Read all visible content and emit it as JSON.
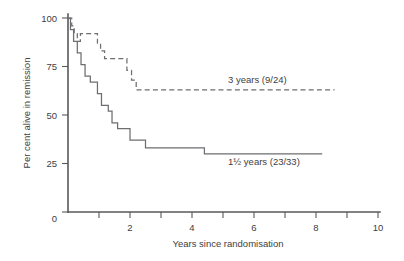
{
  "chart_data": {
    "type": "line",
    "title": "",
    "subtitle": "",
    "xlabel": "Years since randomisation",
    "ylabel": "Per cent alive in remission",
    "xlim": [
      0,
      10
    ],
    "ylim": [
      0,
      100
    ],
    "grid": false,
    "legend_position": "inline-annotations",
    "x_ticks": [
      0,
      1,
      2,
      3,
      4,
      5,
      6,
      7,
      8,
      9,
      10
    ],
    "x_tick_labels": [
      "0",
      "",
      "2",
      "",
      "4",
      "",
      "6",
      "",
      "8",
      "",
      "10"
    ],
    "y_ticks": [
      0,
      25,
      50,
      75,
      100
    ],
    "y_tick_labels": [
      "0",
      "25",
      "50",
      "75",
      "100"
    ],
    "series": [
      {
        "name": "3 years (9/24)",
        "style": "dashed",
        "color": "#6d6e71",
        "annotation": "3 years (9/24)",
        "annotation_x": 5.15,
        "annotation_y": 68,
        "step_points": [
          [
            0.0,
            100
          ],
          [
            0.12,
            100
          ],
          [
            0.12,
            96
          ],
          [
            0.2,
            96
          ],
          [
            0.2,
            92
          ],
          [
            0.3,
            92
          ],
          [
            0.3,
            88
          ],
          [
            0.4,
            88
          ],
          [
            0.4,
            92
          ],
          [
            0.95,
            92
          ],
          [
            0.95,
            87
          ],
          [
            1.05,
            87
          ],
          [
            1.05,
            83
          ],
          [
            1.18,
            83
          ],
          [
            1.18,
            79
          ],
          [
            1.9,
            79
          ],
          [
            1.9,
            73
          ],
          [
            2.05,
            73
          ],
          [
            2.05,
            68
          ],
          [
            2.2,
            68
          ],
          [
            2.2,
            63
          ],
          [
            8.6,
            63
          ]
        ]
      },
      {
        "name": "1½ years (23/33)",
        "style": "solid",
        "color": "#6d6e71",
        "annotation": "1½ years (23/33)",
        "annotation_x": 5.15,
        "annotation_y": 26,
        "step_points": [
          [
            0.0,
            100
          ],
          [
            0.08,
            100
          ],
          [
            0.08,
            94
          ],
          [
            0.18,
            94
          ],
          [
            0.18,
            88
          ],
          [
            0.3,
            88
          ],
          [
            0.3,
            82
          ],
          [
            0.42,
            82
          ],
          [
            0.42,
            76
          ],
          [
            0.55,
            76
          ],
          [
            0.55,
            70
          ],
          [
            0.72,
            70
          ],
          [
            0.72,
            67
          ],
          [
            0.95,
            67
          ],
          [
            0.95,
            61
          ],
          [
            1.08,
            61
          ],
          [
            1.08,
            55
          ],
          [
            1.3,
            55
          ],
          [
            1.3,
            52
          ],
          [
            1.42,
            52
          ],
          [
            1.42,
            46
          ],
          [
            1.6,
            46
          ],
          [
            1.6,
            43
          ],
          [
            2.0,
            43
          ],
          [
            2.0,
            37
          ],
          [
            2.5,
            37
          ],
          [
            2.5,
            33
          ],
          [
            4.4,
            33
          ],
          [
            4.4,
            30
          ],
          [
            8.2,
            30
          ]
        ]
      }
    ]
  },
  "axes": {
    "y_axis_title": "Per cent alive in remission",
    "x_axis_title": "Years since randomisation"
  },
  "labels": {
    "y_100": "100",
    "y_75": "75",
    "y_50": "50",
    "y_25": "25",
    "y_0": "0",
    "x_0": "0",
    "x_2": "2",
    "x_4": "4",
    "x_6": "6",
    "x_8": "8",
    "x_10": "10",
    "series_upper": "3 years (9/24)",
    "series_lower": "1½ years (23/33)"
  },
  "colors": {
    "axis": "#58595b",
    "curve": "#6d6e71",
    "text": "#414042",
    "background": "#ffffff"
  }
}
